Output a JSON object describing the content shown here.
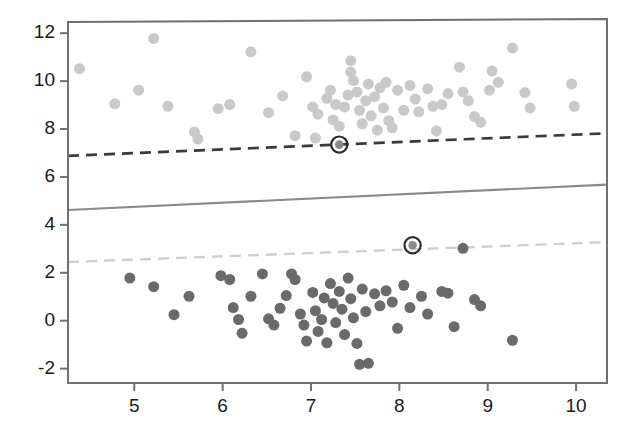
{
  "chart_data": {
    "type": "scatter",
    "title": "",
    "subtitle": "",
    "xlabel": "",
    "ylabel": "",
    "xlim": [
      4.25,
      10.35
    ],
    "ylim": [
      -2.6,
      12.55
    ],
    "xticks": [
      5,
      6,
      7,
      8,
      9,
      10
    ],
    "yticks": [
      -2,
      0,
      2,
      4,
      6,
      8,
      10,
      12
    ],
    "xticklabels": [
      "5",
      "6",
      "7",
      "8",
      "9",
      "10"
    ],
    "yticklabels": [
      "-2",
      "0",
      "2",
      "4",
      "6",
      "8",
      "10",
      "12"
    ],
    "grid": false,
    "legend": "none",
    "frame": true,
    "marker_size": 11,
    "series": [
      {
        "name": "class-positive",
        "color": "#c9c9c9",
        "marker": "circle",
        "points": [
          [
            4.38,
            10.52
          ],
          [
            4.78,
            9.05
          ],
          [
            5.22,
            11.78
          ],
          [
            5.38,
            8.95
          ],
          [
            5.68,
            7.88
          ],
          [
            5.72,
            7.58
          ],
          [
            5.95,
            8.85
          ],
          [
            6.32,
            11.22
          ],
          [
            6.52,
            8.68
          ],
          [
            6.68,
            9.38
          ],
          [
            6.82,
            7.72
          ],
          [
            6.95,
            10.18
          ],
          [
            7.02,
            8.92
          ],
          [
            7.08,
            8.62
          ],
          [
            7.18,
            9.28
          ],
          [
            7.22,
            9.62
          ],
          [
            7.25,
            8.38
          ],
          [
            7.28,
            9.02
          ],
          [
            7.32,
            8.12
          ],
          [
            7.38,
            8.92
          ],
          [
            7.42,
            9.42
          ],
          [
            7.45,
            10.85
          ],
          [
            7.45,
            10.38
          ],
          [
            7.48,
            10.02
          ],
          [
            7.52,
            9.55
          ],
          [
            7.55,
            8.78
          ],
          [
            7.58,
            8.22
          ],
          [
            7.62,
            9.18
          ],
          [
            7.65,
            9.88
          ],
          [
            7.68,
            8.55
          ],
          [
            7.72,
            9.35
          ],
          [
            7.75,
            7.95
          ],
          [
            7.78,
            9.72
          ],
          [
            7.82,
            8.88
          ],
          [
            7.85,
            9.95
          ],
          [
            7.88,
            8.35
          ],
          [
            7.92,
            8.05
          ],
          [
            7.98,
            9.62
          ],
          [
            8.05,
            8.78
          ],
          [
            8.12,
            9.82
          ],
          [
            8.18,
            9.25
          ],
          [
            8.22,
            8.72
          ],
          [
            8.32,
            9.68
          ],
          [
            8.38,
            8.95
          ],
          [
            8.42,
            7.92
          ],
          [
            8.55,
            9.48
          ],
          [
            8.68,
            10.58
          ],
          [
            8.72,
            9.55
          ],
          [
            8.78,
            9.18
          ],
          [
            8.85,
            8.52
          ],
          [
            8.92,
            8.28
          ],
          [
            9.02,
            9.62
          ],
          [
            9.12,
            9.95
          ],
          [
            9.28,
            11.38
          ],
          [
            9.42,
            9.52
          ],
          [
            9.48,
            8.88
          ],
          [
            9.95,
            9.88
          ],
          [
            9.98,
            8.95
          ],
          [
            5.05,
            9.62
          ],
          [
            6.08,
            9.02
          ],
          [
            7.05,
            7.62
          ],
          [
            8.48,
            9.02
          ],
          [
            9.05,
            10.42
          ]
        ]
      },
      {
        "name": "class-negative",
        "color": "#6a6a6a",
        "marker": "circle",
        "points": [
          [
            4.95,
            1.78
          ],
          [
            5.22,
            1.42
          ],
          [
            5.45,
            0.25
          ],
          [
            5.62,
            1.02
          ],
          [
            5.98,
            1.88
          ],
          [
            6.08,
            1.72
          ],
          [
            6.12,
            0.55
          ],
          [
            6.18,
            0.05
          ],
          [
            6.22,
            -0.52
          ],
          [
            6.32,
            1.02
          ],
          [
            6.52,
            0.08
          ],
          [
            6.58,
            -0.18
          ],
          [
            6.72,
            1.05
          ],
          [
            6.78,
            1.95
          ],
          [
            6.82,
            1.72
          ],
          [
            6.88,
            0.28
          ],
          [
            6.92,
            -0.18
          ],
          [
            6.95,
            -0.85
          ],
          [
            7.02,
            1.18
          ],
          [
            7.05,
            0.42
          ],
          [
            7.08,
            -0.45
          ],
          [
            7.12,
            0.05
          ],
          [
            7.18,
            -0.92
          ],
          [
            7.22,
            1.55
          ],
          [
            7.25,
            0.72
          ],
          [
            7.28,
            -0.08
          ],
          [
            7.32,
            1.22
          ],
          [
            7.35,
            0.48
          ],
          [
            7.38,
            -0.58
          ],
          [
            7.42,
            1.78
          ],
          [
            7.45,
            0.92
          ],
          [
            7.48,
            0.12
          ],
          [
            7.52,
            -0.95
          ],
          [
            7.55,
            -1.82
          ],
          [
            7.58,
            1.32
          ],
          [
            7.62,
            0.38
          ],
          [
            7.65,
            -1.78
          ],
          [
            7.72,
            1.12
          ],
          [
            7.78,
            0.62
          ],
          [
            7.85,
            1.25
          ],
          [
            7.92,
            0.78
          ],
          [
            7.98,
            -0.32
          ],
          [
            8.05,
            1.48
          ],
          [
            8.12,
            0.55
          ],
          [
            8.25,
            1.02
          ],
          [
            8.32,
            0.28
          ],
          [
            8.48,
            1.22
          ],
          [
            8.55,
            1.15
          ],
          [
            8.62,
            -0.25
          ],
          [
            8.72,
            3.02
          ],
          [
            8.85,
            0.88
          ],
          [
            8.92,
            0.62
          ],
          [
            9.28,
            -0.82
          ],
          [
            6.45,
            1.95
          ],
          [
            7.15,
            0.95
          ],
          [
            6.65,
            0.52
          ]
        ]
      },
      {
        "name": "support-vectors",
        "color": "#8a8a8a",
        "marker": "circled-circle",
        "points": [
          [
            7.32,
            7.35
          ],
          [
            8.15,
            3.15
          ]
        ]
      }
    ],
    "lines": [
      {
        "name": "upper-margin",
        "style": "dashed",
        "color": "#3a3a3a",
        "width": 2.6,
        "endpoints": [
          [
            4.25,
            6.88
          ],
          [
            10.35,
            7.82
          ]
        ]
      },
      {
        "name": "decision-boundary",
        "style": "solid",
        "color": "#8a8a8a",
        "width": 2.2,
        "endpoints": [
          [
            4.25,
            4.62
          ],
          [
            10.35,
            5.68
          ]
        ]
      },
      {
        "name": "lower-margin",
        "style": "dashed",
        "color": "#cfcfcf",
        "width": 2.4,
        "endpoints": [
          [
            4.25,
            2.45
          ],
          [
            10.35,
            3.28
          ]
        ]
      }
    ]
  },
  "axes": {
    "frame_color": "#707070",
    "tick_color": "#707070",
    "label_color": "#1a1a1a"
  }
}
